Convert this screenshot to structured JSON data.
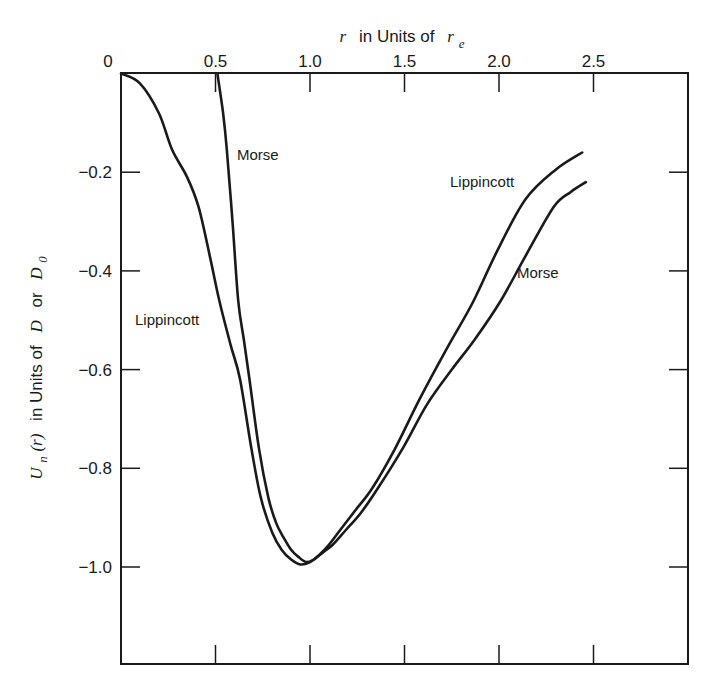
{
  "chart_data": {
    "type": "line",
    "title": "",
    "xlabel": "r in Units of r_e",
    "xlabel_parts": {
      "var": "r",
      "text": "in Units of",
      "unit_var": "r",
      "unit_sub": "e"
    },
    "ylabel": "U_n(r) in Units of D or D_0",
    "ylabel_parts": {
      "func": "U",
      "func_sub": "n",
      "arg": "(r)",
      "text1": "in Units of",
      "v1": "D",
      "text2": "or",
      "v2": "D",
      "v2_sub": "0"
    },
    "x_axis_position": "top",
    "xlim": [
      0,
      2.98
    ],
    "ylim": [
      -1.2,
      0
    ],
    "grid": false,
    "legend": "none (inline curve labels)",
    "x_ticks": [
      0.5,
      1.0,
      1.5,
      2.0,
      2.5
    ],
    "x_tick_labels": [
      "0",
      "0.5",
      "1.0",
      "1.5",
      "2.0",
      "2.5"
    ],
    "y_ticks": [
      -0.2,
      -0.4,
      -0.6,
      -0.8,
      -1.0
    ],
    "y_tick_labels": [
      "0",
      "−0.2",
      "−0.4",
      "−0.6",
      "−0.8",
      "−1.0"
    ],
    "series": [
      {
        "name": "Lippincott",
        "x": [
          0,
          0.1,
          0.2,
          0.27,
          0.35,
          0.41,
          0.47,
          0.52,
          0.58,
          0.63,
          0.69,
          0.74,
          0.8,
          0.85,
          0.9,
          0.95,
          1.0,
          1.05,
          1.1,
          1.16,
          1.24,
          1.33,
          1.45,
          1.58,
          1.72,
          1.86,
          1.99,
          2.14,
          2.3,
          2.44
        ],
        "y": [
          0,
          -0.02,
          -0.08,
          -0.154,
          -0.21,
          -0.27,
          -0.37,
          -0.46,
          -0.55,
          -0.62,
          -0.76,
          -0.86,
          -0.93,
          -0.965,
          -0.985,
          -0.995,
          -0.99,
          -0.975,
          -0.955,
          -0.925,
          -0.885,
          -0.84,
          -0.76,
          -0.66,
          -0.56,
          -0.465,
          -0.36,
          -0.255,
          -0.195,
          -0.16
        ],
        "label_position": [
          {
            "r": 0.075,
            "u": -0.51
          },
          {
            "r": 1.74,
            "u": -0.228
          }
        ]
      },
      {
        "name": "Morse",
        "x": [
          0.51,
          0.54,
          0.56,
          0.59,
          0.62,
          0.65,
          0.68,
          0.73,
          0.78,
          0.82,
          0.86,
          0.9,
          0.94,
          0.98,
          1.02,
          1.07,
          1.12,
          1.19,
          1.27,
          1.36,
          1.49,
          1.62,
          1.75,
          1.87,
          2.01,
          2.14,
          2.29,
          2.38,
          2.46
        ],
        "y": [
          0,
          -0.08,
          -0.154,
          -0.3,
          -0.46,
          -0.54,
          -0.62,
          -0.76,
          -0.86,
          -0.91,
          -0.94,
          -0.965,
          -0.98,
          -0.99,
          -0.985,
          -0.97,
          -0.955,
          -0.925,
          -0.89,
          -0.84,
          -0.76,
          -0.67,
          -0.6,
          -0.54,
          -0.46,
          -0.37,
          -0.27,
          -0.24,
          -0.22
        ],
        "label_position": [
          {
            "r": 0.61,
            "u": -0.174
          },
          {
            "r": 2.09,
            "u": -0.412
          }
        ]
      }
    ]
  },
  "labels": {
    "series_lippincott": "Lippincott",
    "series_morse": "Morse"
  },
  "style": {
    "line_color": "#1a1a1a",
    "background": "#ffffff"
  }
}
